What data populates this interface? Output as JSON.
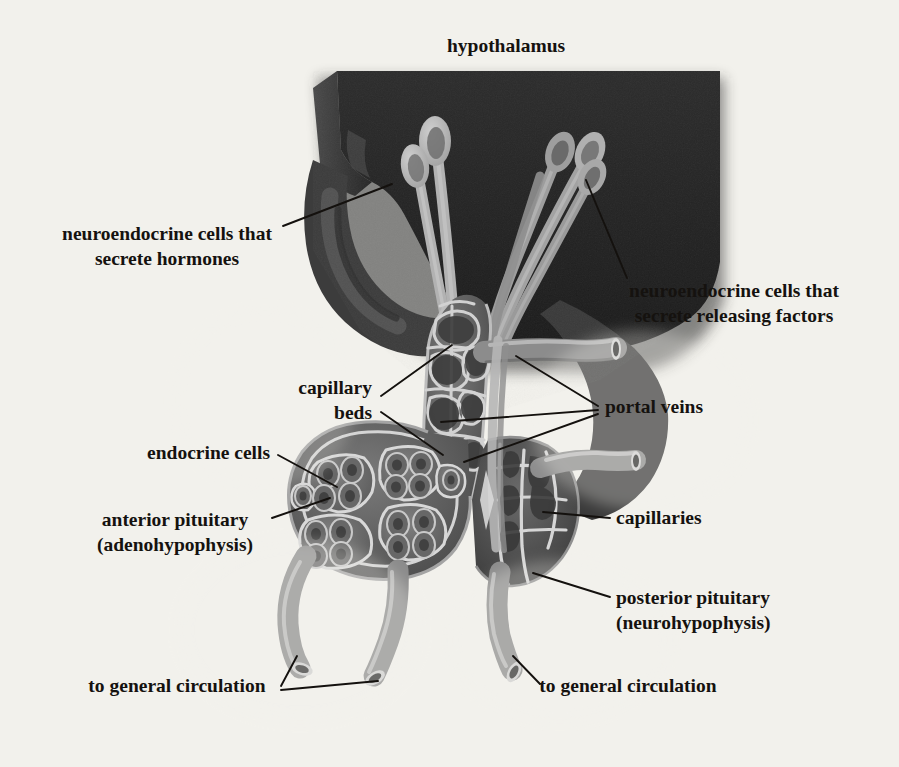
{
  "figure": {
    "name": "hypothalamus-pituitary-diagram",
    "background_color": "#f2f1ec",
    "ink_color": "#15120f",
    "palette": {
      "brain_dark": "#1a1a1a",
      "brain_mid": "#3a3a3a",
      "brain_light": "#555555",
      "tissue_gray": "#6a6a6a",
      "vessel_gray": "#8a8a8a",
      "vessel_highlight": "#c8c8c8",
      "neuron_light": "#b9b9b9",
      "nucleus_dark": "#4a4a4a",
      "halo_white": "#ffffff"
    }
  },
  "title": {
    "text": "hypothalamus",
    "x": 506,
    "y": 52
  },
  "labels": [
    {
      "id": "neuroendocrine-hormones",
      "lines": [
        "neuroendocrine cells that",
        "secrete hormones"
      ],
      "x": 167,
      "y": 240,
      "align": "middle",
      "leaders": [
        [
          [
            283,
            226
          ],
          [
            392,
            184
          ]
        ]
      ]
    },
    {
      "id": "neuroendocrine-releasing-factors",
      "lines": [
        "neuroendocrine cells that",
        "secrete releasing factors"
      ],
      "x": 734,
      "y": 297,
      "align": "middle",
      "leaders": [
        [
          [
            627,
            278
          ],
          [
            586,
            180
          ]
        ]
      ]
    },
    {
      "id": "capillary-beds",
      "lines": [
        "capillary",
        "beds"
      ],
      "x": 372,
      "y": 394,
      "align": "end",
      "leaders": [
        [
          [
            381,
            396
          ],
          [
            452,
            345
          ]
        ],
        [
          [
            381,
            412
          ],
          [
            443,
            455
          ]
        ]
      ]
    },
    {
      "id": "portal-veins",
      "lines": [
        "portal veins"
      ],
      "x": 605,
      "y": 413,
      "align": "start",
      "leaders": [
        [
          [
            598,
            406
          ],
          [
            516,
            356
          ]
        ],
        [
          [
            598,
            410
          ],
          [
            441,
            422
          ]
        ],
        [
          [
            598,
            414
          ],
          [
            464,
            462
          ]
        ]
      ]
    },
    {
      "id": "endocrine-cells",
      "lines": [
        "endocrine cells"
      ],
      "x": 270,
      "y": 459,
      "align": "end",
      "leaders": [
        [
          [
            278,
            455
          ],
          [
            337,
            487
          ]
        ]
      ]
    },
    {
      "id": "anterior-pituitary",
      "lines": [
        "anterior pituitary",
        "(adenohypophysis)"
      ],
      "x": 175,
      "y": 526,
      "align": "middle",
      "leaders": [
        [
          [
            272,
            518
          ],
          [
            330,
            498
          ]
        ]
      ]
    },
    {
      "id": "capillaries",
      "lines": [
        "capillaries"
      ],
      "x": 616,
      "y": 524,
      "align": "start",
      "leaders": [
        [
          [
            610,
            518
          ],
          [
            543,
            512
          ]
        ]
      ]
    },
    {
      "id": "posterior-pituitary",
      "lines": [
        "posterior pituitary",
        "(neurohypophysis)"
      ],
      "x": 616,
      "y": 604,
      "align": "start",
      "leaders": [
        [
          [
            610,
            597
          ],
          [
            533,
            573
          ]
        ]
      ]
    },
    {
      "id": "to-general-circulation-left",
      "lines": [
        "to general circulation"
      ],
      "x": 177,
      "y": 692,
      "align": "middle",
      "leaders": [
        [
          [
            281,
            686
          ],
          [
            297,
            656
          ]
        ],
        [
          [
            281,
            690
          ],
          [
            378,
            681
          ]
        ]
      ]
    },
    {
      "id": "to-general-circulation-right",
      "lines": [
        "to general circulation"
      ],
      "x": 628,
      "y": 692,
      "align": "middle",
      "leaders": [
        [
          [
            540,
            684
          ],
          [
            513,
            656
          ]
        ]
      ]
    }
  ],
  "anatomy": {
    "hypothalamus_block": "dark beveled tissue slab spanning the upper figure",
    "neurons_left": 2,
    "neurons_right": 4,
    "anterior_lobules": 6,
    "outflow_vessels": 3
  }
}
